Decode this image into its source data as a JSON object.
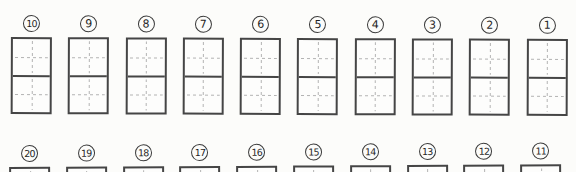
{
  "page": {
    "background_color": "#fcfcfa",
    "line_color": "#454545",
    "guide_color": "#b3b3b3",
    "circle_border_color": "#3a3a3a",
    "number_color": "#1f1f1f"
  },
  "worksheet": {
    "rows": [
      {
        "numbers": [
          "10",
          "9",
          "8",
          "7",
          "6",
          "5",
          "4",
          "3",
          "2",
          "1"
        ]
      },
      {
        "numbers": [
          "20",
          "19",
          "18",
          "17",
          "16",
          "15",
          "14",
          "13",
          "12",
          "11"
        ]
      }
    ]
  }
}
